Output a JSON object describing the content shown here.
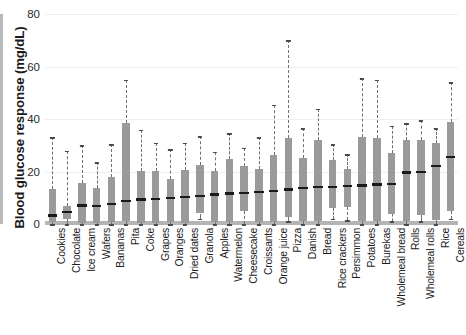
{
  "chart_data": {
    "type": "box",
    "title": "",
    "xlabel": "",
    "ylabel": "Blood glucose response (mg/dL)",
    "ylim": [
      0,
      80
    ],
    "yticks": [
      0,
      20,
      40,
      60,
      80
    ],
    "ytick_labels": [
      "0",
      "20",
      "40",
      "60",
      "80"
    ],
    "grid": true,
    "legend": "none",
    "categories": [
      "Cookies",
      "Chocolate",
      "Ice cream",
      "Wafers",
      "Bananas",
      "Pita",
      "Coke",
      "Grapes",
      "Oranges",
      "Dried dates",
      "Granola",
      "Apples",
      "Watermelon",
      "Cheesecake",
      "Croissants",
      "Orange juice",
      "Pizza",
      "Danish",
      "Bread",
      "Rice crackers",
      "Persimmon",
      "Potatoes",
      "Burekas",
      "Wholemeal bread",
      "Rolls",
      "Wholemeal rolls",
      "Rice",
      "Cereals"
    ],
    "boxes": [
      {
        "category": "Cookies",
        "lower_whisker": 0.0,
        "q1": 0.6,
        "median": 3.2,
        "q3": 13.5,
        "upper_whisker": 33.0
      },
      {
        "category": "Chocolate",
        "lower_whisker": 0.0,
        "q1": 2.0,
        "median": 4.6,
        "q3": 6.8,
        "upper_whisker": 28.0
      },
      {
        "category": "Ice cream",
        "lower_whisker": 0.0,
        "q1": 0.5,
        "median": 7.0,
        "q3": 15.5,
        "upper_whisker": 30.0
      },
      {
        "category": "Wafers",
        "lower_whisker": 0.0,
        "q1": 0.4,
        "median": 6.8,
        "q3": 13.6,
        "upper_whisker": 23.5
      },
      {
        "category": "Bananas",
        "lower_whisker": 0.0,
        "q1": 0.6,
        "median": 7.6,
        "q3": 18.0,
        "upper_whisker": 30.5
      },
      {
        "category": "Pita",
        "lower_whisker": 0.0,
        "q1": 1.0,
        "median": 8.8,
        "q3": 38.5,
        "upper_whisker": 55.0
      },
      {
        "category": "Coke",
        "lower_whisker": 0.0,
        "q1": 0.4,
        "median": 9.4,
        "q3": 20.3,
        "upper_whisker": 36.0
      },
      {
        "category": "Grapes",
        "lower_whisker": 0.0,
        "q1": 0.4,
        "median": 9.6,
        "q3": 20.3,
        "upper_whisker": 31.0
      },
      {
        "category": "Oranges",
        "lower_whisker": 0.0,
        "q1": 0.6,
        "median": 9.8,
        "q3": 17.2,
        "upper_whisker": 28.5
      },
      {
        "category": "Dried dates",
        "lower_whisker": 0.0,
        "q1": 0.4,
        "median": 10.2,
        "q3": 20.5,
        "upper_whisker": 31.0
      },
      {
        "category": "Granola",
        "lower_whisker": 2.0,
        "q1": 4.0,
        "median": 10.6,
        "q3": 22.4,
        "upper_whisker": 33.5
      },
      {
        "category": "Apples",
        "lower_whisker": 0.0,
        "q1": 0.6,
        "median": 11.2,
        "q3": 20.2,
        "upper_whisker": 27.5
      },
      {
        "category": "Watermelon",
        "lower_whisker": 0.0,
        "q1": 0.8,
        "median": 11.6,
        "q3": 24.6,
        "upper_whisker": 34.5
      },
      {
        "category": "Cheesecake",
        "lower_whisker": 0.0,
        "q1": 5.0,
        "median": 11.8,
        "q3": 22.0,
        "upper_whisker": 29.0
      },
      {
        "category": "Croissants",
        "lower_whisker": 0.0,
        "q1": 0.6,
        "median": 12.2,
        "q3": 21.0,
        "upper_whisker": 33.0
      },
      {
        "category": "Orange juice",
        "lower_whisker": 0.0,
        "q1": 0.6,
        "median": 12.5,
        "q3": 26.4,
        "upper_whisker": 45.5
      },
      {
        "category": "Pizza",
        "lower_whisker": 1.0,
        "q1": 2.5,
        "median": 13.2,
        "q3": 32.8,
        "upper_whisker": 70.0
      },
      {
        "category": "Danish",
        "lower_whisker": 0.0,
        "q1": 1.0,
        "median": 13.6,
        "q3": 25.0,
        "upper_whisker": 36.5
      },
      {
        "category": "Bread",
        "lower_whisker": 0.0,
        "q1": 1.0,
        "median": 14.0,
        "q3": 32.0,
        "upper_whisker": 44.0
      },
      {
        "category": "Rice crackers",
        "lower_whisker": 2.0,
        "q1": 6.0,
        "median": 14.2,
        "q3": 24.5,
        "upper_whisker": 30.5
      },
      {
        "category": "Persimmon",
        "lower_whisker": 1.5,
        "q1": 6.5,
        "median": 14.4,
        "q3": 21.0,
        "upper_whisker": 26.5
      },
      {
        "category": "Potatoes",
        "lower_whisker": 0.0,
        "q1": 1.0,
        "median": 14.6,
        "q3": 33.0,
        "upper_whisker": 55.5
      },
      {
        "category": "Burekas",
        "lower_whisker": 0.0,
        "q1": 1.0,
        "median": 15.0,
        "q3": 32.8,
        "upper_whisker": 55.0
      },
      {
        "category": "Wholemeal bread",
        "lower_whisker": 1.0,
        "q1": 4.0,
        "median": 15.2,
        "q3": 27.0,
        "upper_whisker": 37.5
      },
      {
        "category": "Rolls",
        "lower_whisker": 0.0,
        "q1": 1.0,
        "median": 19.6,
        "q3": 32.0,
        "upper_whisker": 38.5
      },
      {
        "category": "Wholemeal rolls",
        "lower_whisker": 1.0,
        "q1": 3.5,
        "median": 19.8,
        "q3": 32.0,
        "upper_whisker": 39.5
      },
      {
        "category": "Rice",
        "lower_whisker": 0.0,
        "q1": 1.5,
        "median": 22.0,
        "q3": 31.0,
        "upper_whisker": 36.5
      },
      {
        "category": "Cereals",
        "lower_whisker": 2.0,
        "q1": 5.0,
        "median": 25.5,
        "q3": 39.0,
        "upper_whisker": 54.0
      }
    ],
    "colors": {
      "box_fill": "#9a9a9a",
      "median_line": "#1a1a1a",
      "whisker": "#6f6f6f",
      "axis": "#b4b4b4",
      "grid": "#efefef",
      "text": "#1a1a1a"
    }
  }
}
